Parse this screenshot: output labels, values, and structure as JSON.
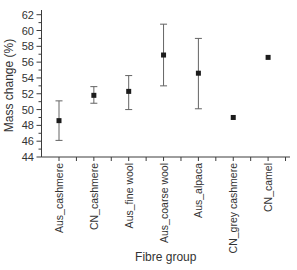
{
  "chart_data": {
    "type": "scatter",
    "subtype": "mean-with-error-bars",
    "title": "",
    "xlabel": "Fibre group",
    "ylabel": "Mass change (%)",
    "ylim": [
      44,
      62
    ],
    "yticks_major": [
      44,
      46,
      48,
      50,
      52,
      54,
      56,
      58,
      60,
      62
    ],
    "yticks_minor": [
      45,
      47,
      49,
      51,
      53,
      55,
      57,
      59,
      61
    ],
    "grid": false,
    "legend": false,
    "categories": [
      "Aus_cashmere",
      "CN_cashmere",
      "Aus_fine wool",
      "Aus_coarse wool",
      "Aus_alpaca",
      "CN_grey cashmere",
      "CN_camel"
    ],
    "series": [
      {
        "name": "Mass change (%)",
        "marker": "filled-square",
        "values": [
          48.6,
          51.8,
          52.3,
          56.9,
          54.6,
          49.0,
          56.6
        ],
        "error_low": [
          46.1,
          50.8,
          50.0,
          53.0,
          50.1,
          49.0,
          56.6
        ],
        "error_high": [
          51.1,
          52.9,
          54.3,
          60.8,
          59.0,
          49.0,
          56.6
        ]
      }
    ],
    "colors": {
      "marker": "#1c1c1c",
      "error_bar": "#646464",
      "axis": "#3d3d3d",
      "tick_text": "#333333",
      "background": "#ffffff"
    }
  }
}
